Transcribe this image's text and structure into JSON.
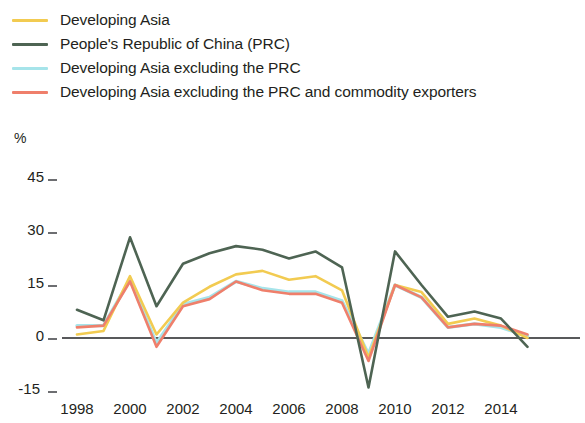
{
  "legend": {
    "position": "top-left",
    "items": [
      {
        "label": "Developing Asia",
        "color": "#f2cb51",
        "key": "developing_asia"
      },
      {
        "label": "People's Republic of China (PRC)",
        "color": "#4e6453",
        "key": "prc"
      },
      {
        "label": "Developing Asia excluding the PRC",
        "color": "#a6e4ea",
        "key": "asia_ex_prc"
      },
      {
        "label": "Developing Asia excluding the PRC and commodity exporters",
        "color": "#ef7f6b",
        "key": "asia_ex_prc_comm"
      }
    ]
  },
  "axes": {
    "y_unit_label": "%",
    "y_ticks": [
      "45",
      "30",
      "15",
      "0",
      "-15"
    ],
    "x_ticks": [
      "1998",
      "2000",
      "2002",
      "2004",
      "2006",
      "2008",
      "2010",
      "2012",
      "2014"
    ]
  },
  "chart_data": {
    "type": "line",
    "title": "",
    "subtitle": "",
    "xlabel": "",
    "ylabel": "%",
    "xlim": [
      1998,
      2015
    ],
    "ylim": [
      -15,
      45
    ],
    "y_ticks": [
      -15,
      0,
      15,
      30,
      45
    ],
    "x_ticks": [
      1998,
      2000,
      2002,
      2004,
      2006,
      2008,
      2010,
      2012,
      2014
    ],
    "grid": false,
    "zero_line": true,
    "legend_position": "top-left",
    "x": [
      1998,
      1999,
      2000,
      2001,
      2002,
      2003,
      2004,
      2005,
      2006,
      2007,
      2008,
      2009,
      2010,
      2011,
      2012,
      2013,
      2014,
      2015
    ],
    "series": [
      {
        "name": "Developing Asia",
        "color": "#f2cb51",
        "values": [
          1.0,
          2.0,
          17.5,
          1.0,
          10.0,
          14.5,
          18.0,
          19.0,
          16.5,
          17.5,
          13.5,
          -5.5,
          15.0,
          13.0,
          4.0,
          5.5,
          3.5,
          0.0
        ]
      },
      {
        "name": "People's Republic of China (PRC)",
        "color": "#4e6453",
        "values": [
          8.0,
          5.0,
          28.5,
          9.0,
          21.0,
          24.0,
          26.0,
          25.0,
          22.5,
          24.5,
          20.0,
          -14.0,
          24.5,
          15.0,
          6.0,
          7.5,
          5.5,
          -2.5
        ]
      },
      {
        "name": "Developing Asia excluding the PRC",
        "color": "#a6e4ea",
        "values": [
          3.5,
          3.5,
          16.5,
          -1.5,
          9.5,
          11.5,
          16.0,
          14.0,
          13.0,
          13.0,
          10.5,
          -4.5,
          15.0,
          11.5,
          3.0,
          4.0,
          3.0,
          0.5
        ]
      },
      {
        "name": "Developing Asia excluding the PRC and commodity exporters",
        "color": "#ef7f6b",
        "values": [
          3.0,
          3.5,
          16.0,
          -2.5,
          9.0,
          11.0,
          16.0,
          13.5,
          12.5,
          12.5,
          10.0,
          -6.5,
          15.0,
          11.5,
          3.0,
          4.0,
          3.5,
          1.0
        ]
      }
    ]
  }
}
